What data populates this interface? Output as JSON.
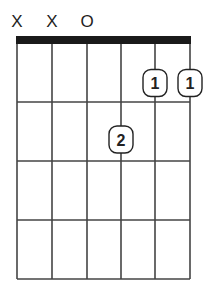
{
  "chord": {
    "string_markers": [
      {
        "string": 1,
        "symbol": "X"
      },
      {
        "string": 2,
        "symbol": "X"
      },
      {
        "string": 3,
        "symbol": "O"
      }
    ],
    "fingers": [
      {
        "string": 5,
        "fret": 1,
        "label": "1"
      },
      {
        "string": 6,
        "fret": 1,
        "label": "1"
      },
      {
        "string": 4,
        "fret": 2,
        "label": "2"
      }
    ],
    "num_strings": 6,
    "num_frets": 4
  },
  "colors": {
    "line": "#444444",
    "nut": "#1a1a1a",
    "text": "#222222",
    "finger_border": "#222222",
    "finger_fill": "#ffffff"
  }
}
